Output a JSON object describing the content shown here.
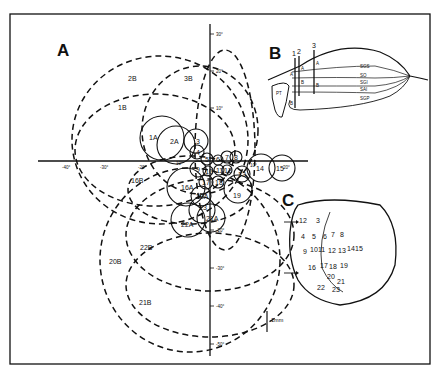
{
  "panels": {
    "A": {
      "letter": "A"
    },
    "B": {
      "letter": "B"
    },
    "C": {
      "letter": "C"
    }
  },
  "panel_a": {
    "x_ticks": [
      {
        "label": "-40°",
        "x": 68
      },
      {
        "label": "-30°",
        "x": 105
      },
      {
        "label": "-20°",
        "x": 143
      },
      {
        "label": "10°",
        "x": 180
      },
      {
        "label": "10°",
        "x": 254
      },
      {
        "label": "20°",
        "x": 292
      }
    ],
    "y_ticks": [
      {
        "label": "30°",
        "y": 34
      },
      {
        "label": "20°",
        "y": 71
      },
      {
        "label": "10°",
        "y": 108
      },
      {
        "label": "-20°",
        "y": 230
      },
      {
        "label": "-30°",
        "y": 268
      },
      {
        "label": "-40°",
        "y": 306
      },
      {
        "label": "-50°",
        "y": 344
      }
    ],
    "large_fields": [
      {
        "label": "2B"
      },
      {
        "label": "3B"
      },
      {
        "label": "1B"
      },
      {
        "label": "16B"
      },
      {
        "label": "20B"
      },
      {
        "label": "22B"
      },
      {
        "label": "21B"
      }
    ],
    "small_fields": [
      {
        "label": "1A"
      },
      {
        "label": "2A"
      },
      {
        "label": "3"
      },
      {
        "label": "4"
      },
      {
        "label": "5"
      },
      {
        "label": "6"
      },
      {
        "label": "7"
      },
      {
        "label": "8"
      },
      {
        "label": "9"
      },
      {
        "label": "10"
      },
      {
        "label": "11"
      },
      {
        "label": "12"
      },
      {
        "label": "13"
      },
      {
        "label": "14"
      },
      {
        "label": "15"
      },
      {
        "label": "16A"
      },
      {
        "label": "17"
      },
      {
        "label": "18"
      },
      {
        "label": "19"
      },
      {
        "label": "20A"
      },
      {
        "label": "21A"
      },
      {
        "label": "22A"
      },
      {
        "label": "23"
      }
    ]
  },
  "panel_b": {
    "track_labels": [
      "1",
      "2",
      "3"
    ],
    "layers": [
      "SGS",
      "SO",
      "SGI",
      "SAI",
      "SGP"
    ],
    "structure": "PT",
    "site_marks": [
      "A",
      "A",
      "A",
      "B",
      "B",
      "B"
    ]
  },
  "panel_c": {
    "sites": [
      "1",
      "2",
      "3",
      "4",
      "5",
      "6",
      "7",
      "8",
      "9",
      "10",
      "11",
      "12",
      "13",
      "14",
      "15",
      "16",
      "17",
      "18",
      "19",
      "20",
      "21",
      "22",
      "23"
    ],
    "scale_bar": "1mm"
  }
}
